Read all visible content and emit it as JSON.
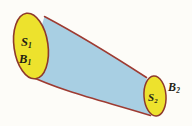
{
  "figure": {
    "background_color": "#fdfcf8",
    "tube": {
      "name": "tube-body",
      "fill_color": "#a8cfe3",
      "outline_color": "#9e3b32"
    },
    "caps": [
      {
        "id": "cap-left",
        "fill_color": "#ede22d",
        "outline_color": "#8e3a2c",
        "center_x": 31,
        "center_y": 46,
        "radius_x": 17,
        "radius_y": 33,
        "rotation_deg": -8
      },
      {
        "id": "cap-right",
        "fill_color": "#ede22d",
        "outline_color": "#8e3a2c",
        "center_x": 155,
        "center_y": 96,
        "radius_x": 11,
        "radius_y": 20,
        "rotation_deg": -4
      }
    ],
    "labels": [
      {
        "id": "S1",
        "base": "S",
        "subscript": "1",
        "x": 21,
        "y": 36
      },
      {
        "id": "B1",
        "base": "B",
        "subscript": "1",
        "x": 19,
        "y": 53
      },
      {
        "id": "S2",
        "base": "S",
        "subscript": "2",
        "x": 148,
        "y": 92
      },
      {
        "id": "B2",
        "base": "B",
        "subscript": "2",
        "x": 168,
        "y": 81
      }
    ]
  }
}
